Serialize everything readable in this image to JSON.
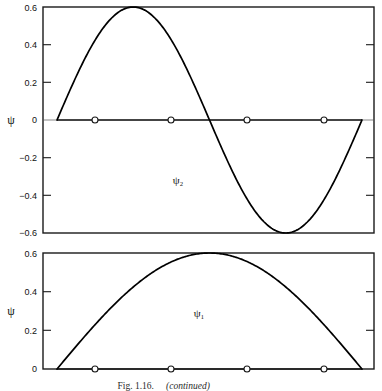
{
  "figure": {
    "caption_prefix": "Fig. 1.16.",
    "caption_suffix": "(continued)",
    "background_color": "#ffffff",
    "curve_color": "#000000",
    "frame_color": "#1a1a1a"
  },
  "panels": {
    "top": {
      "name": "psi-2-panel",
      "curve_label": "ψ₂",
      "axis_label": "ψ",
      "ytick_labels": [
        "0.6",
        "0.4",
        "0.2",
        "0",
        "−0.2",
        "−0.4",
        "−0.6"
      ],
      "ytick_values": [
        0.6,
        0.4,
        0.2,
        0,
        -0.2,
        -0.4,
        -0.6
      ]
    },
    "bottom": {
      "name": "psi-1-panel",
      "curve_label": "ψ₁",
      "axis_label": "ψ",
      "ytick_labels": [
        "0.6",
        "0.4",
        "0.2",
        "0"
      ],
      "ytick_values": [
        0.6,
        0.4,
        0.2,
        0
      ]
    }
  },
  "chart_data": [
    {
      "type": "line",
      "name": "psi-2",
      "title": "ψ₂",
      "xlabel": "",
      "ylabel": "ψ",
      "ylim": [
        -0.6,
        0.6
      ],
      "xlim": [
        0,
        1
      ],
      "grid": false,
      "legend": false,
      "amplitude": 0.6,
      "half_waves": 2,
      "function": "0.6 * sin(2 * pi * x)",
      "ytick_labels": [
        "0.6",
        "0.4",
        "0.2",
        "0",
        "−0.2",
        "−0.4",
        "−0.6"
      ],
      "ytick_values": [
        0.6,
        0.4,
        0.2,
        0,
        -0.2,
        -0.4,
        -0.6
      ],
      "node_markers_x": [
        0.125,
        0.375,
        0.625,
        0.875
      ],
      "node_markers_y": [
        0,
        0,
        0,
        0
      ],
      "x": [
        0,
        0.05,
        0.1,
        0.15,
        0.2,
        0.25,
        0.3,
        0.35,
        0.4,
        0.45,
        0.5,
        0.55,
        0.6,
        0.65,
        0.7,
        0.75,
        0.8,
        0.85,
        0.9,
        0.95,
        1
      ],
      "y": [
        0,
        0.185,
        0.353,
        0.486,
        0.571,
        0.6,
        0.571,
        0.486,
        0.353,
        0.185,
        0,
        -0.185,
        -0.353,
        -0.486,
        -0.571,
        -0.6,
        -0.571,
        -0.486,
        -0.353,
        -0.185,
        0
      ]
    },
    {
      "type": "line",
      "name": "psi-1",
      "title": "ψ₁",
      "xlabel": "",
      "ylabel": "ψ",
      "ylim": [
        0,
        0.6
      ],
      "xlim": [
        0,
        1
      ],
      "grid": false,
      "legend": false,
      "amplitude": 0.6,
      "half_waves": 1,
      "function": "0.6 * sin(pi * x)",
      "ytick_labels": [
        "0.6",
        "0.4",
        "0.2",
        "0"
      ],
      "ytick_values": [
        0.6,
        0.4,
        0.2,
        0
      ],
      "node_markers_x": [
        0.125,
        0.375,
        0.625,
        0.875
      ],
      "node_markers_y": [
        0,
        0,
        0,
        0
      ],
      "x": [
        0,
        0.05,
        0.1,
        0.15,
        0.2,
        0.25,
        0.3,
        0.35,
        0.4,
        0.45,
        0.5,
        0.55,
        0.6,
        0.65,
        0.7,
        0.75,
        0.8,
        0.85,
        0.9,
        0.95,
        1
      ],
      "y": [
        0,
        0.094,
        0.185,
        0.271,
        0.353,
        0.424,
        0.486,
        0.54,
        0.571,
        0.595,
        0.6,
        0.595,
        0.571,
        0.54,
        0.486,
        0.424,
        0.353,
        0.271,
        0.185,
        0.094,
        0
      ]
    }
  ]
}
